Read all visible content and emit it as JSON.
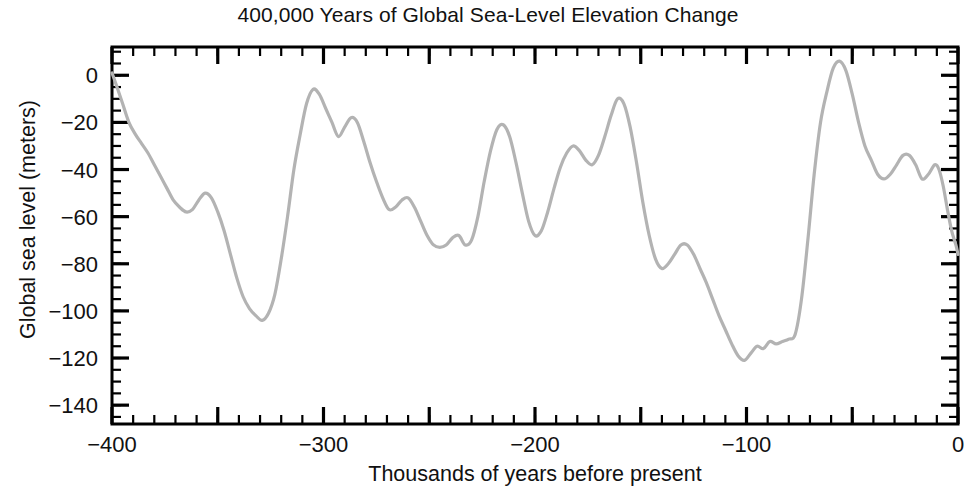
{
  "chart_data": {
    "type": "line",
    "title": "400,000 Years of Global Sea-Level Elevation Change",
    "xlabel": "Thousands of years before present",
    "ylabel": "Global sea level (meters)",
    "xlim": [
      -400,
      0
    ],
    "ylim": [
      -148,
      12
    ],
    "grid": false,
    "legend": null,
    "series_name": "Global sea level",
    "line_color": "#b3b3b3",
    "axis_color": "#000000",
    "background_color": "#ffffff",
    "xticks_major": [
      -400,
      -350,
      -300,
      -250,
      -200,
      -150,
      -100,
      -50,
      0
    ],
    "xticks_labeled": [
      -400,
      -300,
      -200,
      -100,
      0
    ],
    "xtick_labels": [
      "-400",
      "-300",
      "-200",
      "-100",
      "0"
    ],
    "xtick_minor_step": 10,
    "yticks_major": [
      0,
      -20,
      -40,
      -60,
      -80,
      -100,
      -120,
      -140
    ],
    "ytick_labels": [
      "0",
      "-20",
      "-40",
      "-60",
      "-80",
      "-100",
      "-120",
      "-140"
    ],
    "ytick_minor_step": 5,
    "x": [
      -400,
      -398,
      -395,
      -392,
      -389,
      -386,
      -383,
      -380,
      -377,
      -374,
      -371,
      -368,
      -365,
      -362,
      -359,
      -356,
      -353,
      -350,
      -347,
      -344,
      -341,
      -338,
      -335,
      -332,
      -329,
      -326,
      -323,
      -320,
      -317,
      -314,
      -311,
      -308,
      -305,
      -302,
      -299,
      -296,
      -293,
      -290,
      -287,
      -284,
      -281,
      -278,
      -275,
      -272,
      -269,
      -266,
      -263,
      -260,
      -257,
      -254,
      -251,
      -248,
      -245,
      -242,
      -239,
      -236,
      -233,
      -230,
      -227,
      -224,
      -221,
      -218,
      -215,
      -212,
      -209,
      -206,
      -203,
      -200,
      -197,
      -194,
      -191,
      -188,
      -185,
      -182,
      -179,
      -176,
      -173,
      -170,
      -167,
      -164,
      -161,
      -158,
      -155,
      -152,
      -149,
      -146,
      -143,
      -140,
      -137,
      -134,
      -131,
      -128,
      -125,
      -122,
      -119,
      -116,
      -113,
      -110,
      -107,
      -104,
      -101,
      -98,
      -95,
      -92,
      -89,
      -86,
      -83,
      -80,
      -77,
      -74,
      -71,
      -68,
      -65,
      -62,
      -59,
      -56,
      -53,
      -50,
      -47,
      -44,
      -41,
      -38,
      -35,
      -32,
      -29,
      -26,
      -23,
      -20,
      -17,
      -14,
      -11,
      -9,
      -7,
      -5,
      -3,
      -1,
      0
    ],
    "y": [
      1,
      -4,
      -12,
      -20,
      -25,
      -29,
      -33,
      -38,
      -43,
      -48,
      -53,
      -56,
      -58,
      -57,
      -53,
      -50,
      -52,
      -58,
      -66,
      -76,
      -86,
      -94,
      -99,
      -102,
      -104,
      -101,
      -93,
      -78,
      -60,
      -40,
      -25,
      -12,
      -6,
      -8,
      -14,
      -20,
      -26,
      -22,
      -18,
      -20,
      -28,
      -37,
      -45,
      -52,
      -57,
      -56,
      -53,
      -52,
      -56,
      -62,
      -68,
      -72,
      -73,
      -72,
      -69,
      -68,
      -72,
      -70,
      -60,
      -45,
      -32,
      -23,
      -21,
      -26,
      -37,
      -50,
      -62,
      -68,
      -66,
      -58,
      -48,
      -39,
      -33,
      -30,
      -32,
      -36,
      -38,
      -34,
      -26,
      -17,
      -10,
      -12,
      -22,
      -37,
      -54,
      -68,
      -78,
      -82,
      -80,
      -76,
      -72,
      -72,
      -76,
      -82,
      -88,
      -95,
      -102,
      -108,
      -114,
      -119,
      -121,
      -118,
      -115,
      -116,
      -113,
      -114,
      -113,
      -112,
      -110,
      -95,
      -70,
      -42,
      -20,
      -7,
      3,
      6,
      2,
      -8,
      -20,
      -30,
      -36,
      -42,
      -44,
      -42,
      -38,
      -34,
      -34,
      -38,
      -44,
      -42,
      -38,
      -40,
      -47,
      -57,
      -66,
      -72,
      -76,
      -78,
      -80,
      -82,
      -80,
      -76,
      -73,
      -74,
      -78,
      -84,
      -90,
      -96,
      -100,
      -102,
      -103,
      -100,
      -95,
      -92,
      -91,
      -93,
      -98,
      -106,
      -114,
      -121,
      -126,
      -128,
      -127,
      -122,
      -110,
      -90,
      -64,
      -38,
      -18,
      -8,
      -4,
      -2,
      -1
    ]
  }
}
